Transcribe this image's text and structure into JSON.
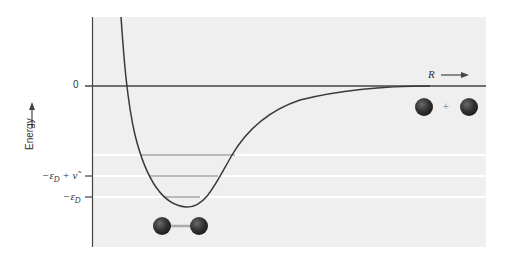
{
  "diagram": {
    "y_axis_label": "Energy",
    "x_axis_label": "R",
    "y_ticks": [
      {
        "label": "0",
        "y": 86
      },
      {
        "label": "−ε",
        "sub": "D",
        "suffix": " + ν̃",
        "y": 176
      },
      {
        "label": "−ε",
        "sub": "D",
        "suffix": "",
        "y": 197
      }
    ],
    "vibrational_levels": [
      {
        "y": 155,
        "x1": 141,
        "x2": 235
      },
      {
        "y": 176,
        "x1": 150,
        "x2": 218
      },
      {
        "y": 197,
        "x1": 163,
        "x2": 200
      }
    ],
    "bound_molecule_label": "bonded diatomic",
    "separated_atoms_plus": "+",
    "colors": {
      "panel": "#efefef",
      "curve": "#3a3a3a",
      "axis": "#444444",
      "atom": "#333333",
      "guide_lines": "#ffffff"
    }
  }
}
